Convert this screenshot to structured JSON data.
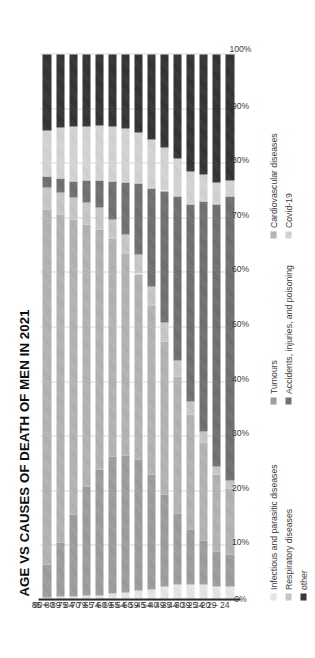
{
  "chart_data": {
    "type": "bar",
    "orientation": "horizontal-stacked-100",
    "title": "AGE VS CAUSES OF DEATH OF MEN IN 2021",
    "xlabel": "",
    "ylabel": "",
    "xlim": [
      0,
      100
    ],
    "grid": true,
    "legend_position": "bottom",
    "value_ticks": [
      "100%",
      "90%",
      "80%",
      "70%",
      "60%",
      "50%",
      "40%",
      "30%",
      "20%",
      "10%",
      "0%"
    ],
    "value_tick_numbers": [
      100,
      90,
      80,
      70,
      60,
      50,
      40,
      30,
      20,
      10,
      0
    ],
    "categories": [
      "20 – 24",
      "25 – 29",
      "30 – 34",
      "35 – 39",
      "40 – 44",
      "45 – 49",
      "50 – 54",
      "55 – 59",
      "60 – 64",
      "65 – 69",
      "70 – 74",
      "75 – 79",
      "80 – 84",
      "85 – 89",
      "90+"
    ],
    "series": [
      {
        "name": "Infectious and parasitic diseases",
        "color": "#e8e8e8",
        "values": [
          2.5,
          2.5,
          3.0,
          3.0,
          3.0,
          2.5,
          2.0,
          1.8,
          1.5,
          1.3,
          1.0,
          0.9,
          0.8,
          0.7,
          0.6
        ]
      },
      {
        "name": "Tumours",
        "color": "#9c9c9c",
        "values": [
          6.0,
          6.5,
          8.0,
          10.0,
          13.0,
          17.0,
          21.0,
          24.0,
          25.0,
          25.0,
          23.0,
          20.0,
          15.0,
          10.0,
          6.0
        ]
      },
      {
        "name": "Cardiovascular diseases",
        "color": "#b3b3b3",
        "values": [
          12.0,
          14.0,
          18.0,
          21.0,
          25.0,
          28.0,
          31.0,
          34.0,
          37.0,
          40.0,
          44.0,
          48.0,
          54.0,
          60.0,
          65.0
        ]
      },
      {
        "name": "Respiratory diseases",
        "color": "#c7c7c7",
        "values": [
          1.5,
          1.5,
          2.0,
          2.5,
          3.0,
          3.5,
          3.5,
          3.5,
          3.5,
          3.5,
          4.0,
          4.0,
          4.0,
          4.0,
          4.0
        ]
      },
      {
        "name": "Accidents, injuries, and poisoning",
        "color": "#6e6e6e",
        "values": [
          52.0,
          48.0,
          42.0,
          36.0,
          30.0,
          24.0,
          18.0,
          13.0,
          9.5,
          7.0,
          5.0,
          4.0,
          3.0,
          2.5,
          2.0
        ]
      },
      {
        "name": "Covid-19",
        "color": "#d4d4d4",
        "values": [
          3.0,
          4.0,
          5.0,
          6.0,
          7.0,
          8.0,
          9.0,
          9.5,
          10.0,
          10.0,
          10.0,
          10.0,
          10.0,
          9.5,
          8.5
        ]
      },
      {
        "name": "other",
        "color": "#303030",
        "values": [
          23.0,
          23.5,
          22.0,
          21.5,
          19.0,
          17.0,
          15.5,
          14.2,
          13.5,
          13.2,
          13.0,
          13.1,
          13.2,
          13.3,
          13.9
        ]
      }
    ]
  },
  "legend": {
    "items": [
      {
        "label": "Infectious and parasitic diseases",
        "color": "#e8e8e8"
      },
      {
        "label": "Tumours",
        "color": "#9c9c9c"
      },
      {
        "label": "Cardiovascular diseases",
        "color": "#b3b3b3"
      },
      {
        "label": "Respiratory diseases",
        "color": "#c7c7c7"
      },
      {
        "label": "Accidents, injuries, and poisoning",
        "color": "#6e6e6e"
      },
      {
        "label": "Covid-19",
        "color": "#d4d4d4"
      },
      {
        "label": "other",
        "color": "#303030"
      }
    ]
  }
}
